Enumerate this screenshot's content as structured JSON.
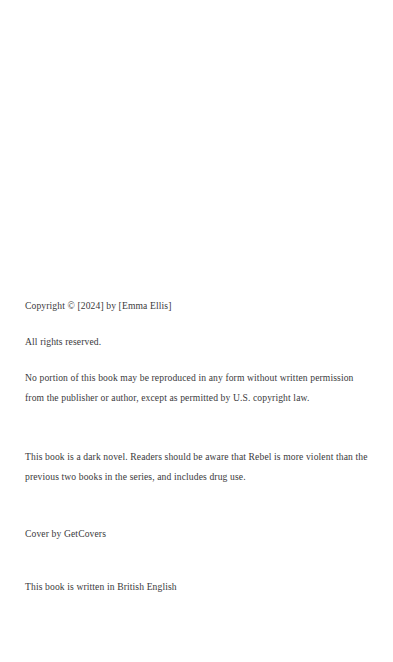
{
  "document": {
    "type": "book-copyright-page",
    "background_color": "#ffffff",
    "text_color": "#3a3a3c",
    "alignment": "left",
    "blocks": {
      "copyright_notice": "Copyright © [2024] by [Emma Ellis]",
      "rights_reserved": "All rights reserved.",
      "reproduction_notice": "No portion of this book may be reproduced in any form without written permission from the publisher or author, except as permitted by U.S. copyright law.",
      "content_warning": "This book is a dark novel. Readers should be aware that Rebel is more violent than the previous two books in the series, and includes drug use.",
      "cover_credit": "Cover by GetCovers",
      "language_note": "This book is written in British English"
    }
  }
}
